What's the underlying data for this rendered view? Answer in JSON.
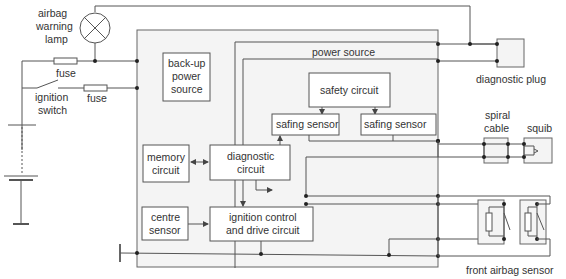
{
  "diagram": {
    "labels": {
      "warning_lamp": [
        "airbag",
        "warning",
        "lamp"
      ],
      "fuse1": "fuse",
      "fuse2": "fuse",
      "ignition_switch": [
        "ignition",
        "switch"
      ],
      "backup_power": [
        "back-up",
        "power",
        "source"
      ],
      "power_source": "power source",
      "safety_circuit": "safety circuit",
      "safing_sensor_1": "safing sensor",
      "safing_sensor_2": "safing sensor",
      "memory_circuit": [
        "memory",
        "circuit"
      ],
      "diagnostic_circuit": [
        "diagnostic",
        "circuit"
      ],
      "centre_sensor": [
        "centre",
        "sensor"
      ],
      "ignition_control": [
        "ignition control",
        "and drive circuit"
      ],
      "diagnostic_plug": "diagnostic plug",
      "spiral_cable": [
        "spiral",
        "cable"
      ],
      "squib": "squib",
      "front_airbag_sensor": "front airbag sensor"
    },
    "colors": {
      "line": "#555555",
      "panel_fill": "#f4f4f4",
      "box_fill": "#ffffff",
      "text": "#333333"
    }
  }
}
